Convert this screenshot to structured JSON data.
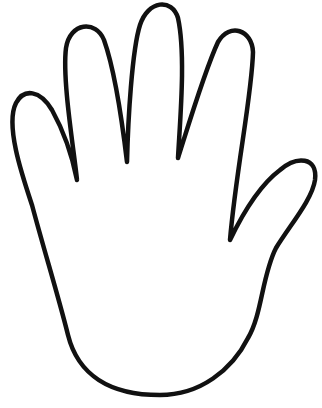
{
  "image": {
    "subject": "hand-outline",
    "background_color": "#ffffff",
    "stroke_color": "#111111",
    "stroke_width": 4.5
  }
}
